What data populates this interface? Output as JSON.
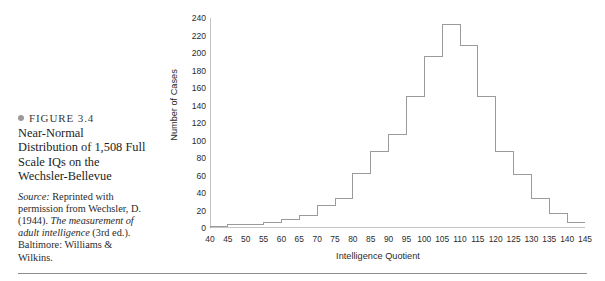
{
  "figure": {
    "label": "FIGURE 3.4",
    "bullet_icon": "bullet-dot-icon",
    "title": "Near-Normal Distribution of 1,508 Full Scale IQs on the Wechsler-Bellevue",
    "source_label": "Source:",
    "source_text_1": "Reprinted with permission from Wechsler, D. (1944).",
    "source_italic_1": "The measurement of adult intelligence",
    "source_text_2": "(3rd ed.). Baltimore: Williams & Wilkins."
  },
  "colors": {
    "axis": "#8a8a8a",
    "step_line": "#9b9b9b",
    "text": "#1d1d1d",
    "bullet": "#9a9a9a",
    "rule": "#8c8c8c"
  },
  "chart_data": {
    "type": "bar",
    "title": "",
    "xlabel": "Intelligence Quotient",
    "ylabel": "Number of Cases",
    "xlim": [
      40,
      145
    ],
    "ylim": [
      0,
      240
    ],
    "ytick_step": 20,
    "xtick_step": 5,
    "grid": false,
    "legend": "none",
    "bin_width": 5,
    "render_style": "step-outline",
    "total_cases": 1508,
    "xticks": [
      40,
      45,
      50,
      55,
      60,
      65,
      70,
      75,
      80,
      85,
      90,
      95,
      100,
      105,
      110,
      115,
      120,
      125,
      130,
      135,
      140,
      145
    ],
    "yticks": [
      0,
      20,
      40,
      60,
      80,
      100,
      120,
      140,
      160,
      180,
      200,
      220,
      240
    ],
    "categories": [
      "40-45",
      "45-50",
      "50-55",
      "55-60",
      "60-65",
      "65-70",
      "70-75",
      "75-80",
      "80-85",
      "85-90",
      "90-95",
      "95-100",
      "100-105",
      "105-110",
      "110-115",
      "115-120",
      "120-125",
      "125-130",
      "130-135",
      "135-140",
      "140-145"
    ],
    "bin_starts": [
      40,
      45,
      50,
      55,
      60,
      65,
      70,
      75,
      80,
      85,
      90,
      95,
      100,
      105,
      110,
      115,
      120,
      125,
      130,
      135,
      140
    ],
    "values": [
      2,
      4,
      4,
      6,
      10,
      14,
      26,
      34,
      62,
      88,
      107,
      150,
      196,
      233,
      209,
      150,
      87,
      61,
      34,
      17,
      6
    ],
    "series": [
      {
        "name": "Number of Cases",
        "values": [
          2,
          4,
          4,
          6,
          10,
          14,
          26,
          34,
          62,
          88,
          107,
          150,
          196,
          233,
          209,
          150,
          87,
          61,
          34,
          17,
          6
        ]
      }
    ]
  }
}
